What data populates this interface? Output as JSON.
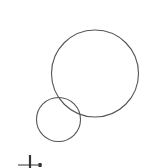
{
  "diagram": {
    "background": "#ffffff",
    "stroke_color": "#555555",
    "circles": [
      {
        "name": "large-circle",
        "cx": 95,
        "cy": 73.5,
        "r": 43.5
      },
      {
        "name": "small-circle",
        "cx": 58.5,
        "cy": 119.5,
        "r": 22
      }
    ],
    "marker": {
      "name": "axis-marker",
      "hline": {
        "x1": 18,
        "x2": 42,
        "y": 165
      },
      "vline": {
        "x": 30,
        "y1": 155,
        "y2": 168
      },
      "dot": {
        "x": 38.5,
        "y": 163,
        "w": 3,
        "h": 4
      },
      "color": "#333333"
    }
  }
}
